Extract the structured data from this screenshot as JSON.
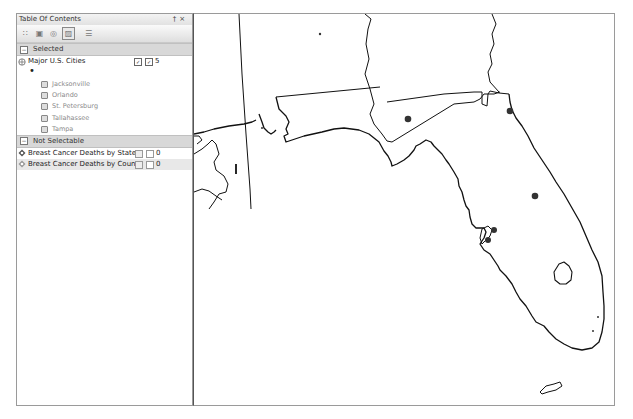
{
  "toc": {
    "title": "Table Of Contents",
    "pin_glyph": "†",
    "close_glyph": "×",
    "toolbar": [
      {
        "name": "list-by-drawing-order-icon",
        "glyph": "∷",
        "active": false
      },
      {
        "name": "list-by-source-icon",
        "glyph": "▣",
        "active": false
      },
      {
        "name": "list-by-visibility-icon",
        "glyph": "◎",
        "active": false
      },
      {
        "name": "list-by-selection-icon",
        "glyph": "▨",
        "active": true
      },
      {
        "name": "options-icon",
        "glyph": "☰",
        "active": false
      }
    ],
    "groups": {
      "selected": {
        "label": "Selected",
        "toggle": "−",
        "layers": [
          {
            "name": "Major U.S. Cities",
            "count": "5",
            "symbol": "•",
            "features": [
              "Jacksonville",
              "Orlando",
              "St. Petersburg",
              "Tallahassee",
              "Tampa"
            ]
          }
        ]
      },
      "not_selectable": {
        "label": "Not Selectable",
        "toggle": "−",
        "layers": [
          {
            "name": "Breast Cancer Deaths by State",
            "count": "0"
          },
          {
            "name": "Breast Cancer Deaths by County",
            "count": "0"
          }
        ]
      }
    }
  },
  "map": {
    "region": "Florida",
    "selected_cities": [
      {
        "name": "Tallahassee",
        "x": 214,
        "y": 105
      },
      {
        "name": "Jacksonville",
        "x": 316,
        "y": 97
      },
      {
        "name": "Orlando",
        "x": 341,
        "y": 182
      },
      {
        "name": "Tampa",
        "x": 301,
        "y": 216
      },
      {
        "name": "St. Petersburg",
        "x": 294,
        "y": 226
      }
    ],
    "colors": {
      "outline": "#111111",
      "point": "#333333",
      "background": "#ffffff"
    }
  }
}
